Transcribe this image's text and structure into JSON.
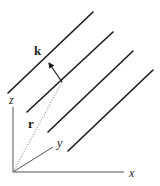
{
  "figure": {
    "labels": {
      "k": "k",
      "r": "r",
      "x": "x",
      "y": "y",
      "z": "z"
    },
    "colors": {
      "wavefront": "#1a1a1a",
      "axis": "#555555",
      "r_vector": "#777777",
      "background": "#ffffff"
    },
    "wavefronts": [
      {
        "x1": 8,
        "y1": 93,
        "x2": 93,
        "y2": 12
      },
      {
        "x1": 27,
        "y1": 112,
        "x2": 113,
        "y2": 32
      },
      {
        "x1": 48,
        "y1": 132,
        "x2": 133,
        "y2": 51
      },
      {
        "x1": 68,
        "y1": 151,
        "x2": 153,
        "y2": 70
      }
    ],
    "origin": {
      "x": 13,
      "y": 172
    },
    "axes": {
      "x_end": {
        "x": 124,
        "y": 172
      },
      "y_end": {
        "x": 53,
        "y": 147
      },
      "z_end": {
        "x": 13,
        "y": 107
      }
    },
    "k_vector": {
      "x1": 62,
      "y1": 82,
      "x2": 49,
      "y2": 63
    },
    "r_vector": {
      "x1": 13,
      "y1": 172,
      "x2": 62,
      "y2": 82
    }
  }
}
